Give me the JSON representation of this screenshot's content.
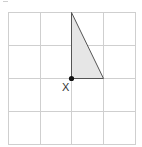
{
  "diagram": {
    "type": "grid-with-triangle",
    "grid": {
      "rows": 4,
      "cols": 4,
      "line_color": "#cfcfcf"
    },
    "triangle": {
      "fill": "#e6e6e6",
      "stroke": "#555555",
      "vertices_grid": [
        [
          2,
          0
        ],
        [
          2,
          2
        ],
        [
          3,
          2
        ]
      ]
    },
    "point": {
      "label": "X",
      "grid_position": [
        2,
        2
      ],
      "color": "#111111"
    }
  }
}
